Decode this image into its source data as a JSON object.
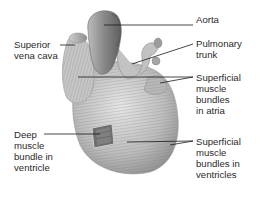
{
  "diagram": {
    "labels": [
      {
        "id": "aorta",
        "text": "Aorta",
        "x": 196,
        "y": 14
      },
      {
        "id": "pulmonary-trunk",
        "text": "Pulmonary\ntrunk",
        "x": 196,
        "y": 39
      },
      {
        "id": "superficial-atria",
        "text": "Superficial\nmuscle\nbundles\nin atria",
        "x": 196,
        "y": 73
      },
      {
        "id": "superior-vena-cava",
        "text": "Superior\nvena cava",
        "x": 14,
        "y": 40
      },
      {
        "id": "deep-ventricle",
        "text": "Deep\nmuscle\nbundle in\nventricle",
        "x": 14,
        "y": 130
      },
      {
        "id": "superficial-ventricles",
        "text": "Superficial\nmuscle\nbundles in\nventricles",
        "x": 196,
        "y": 137
      }
    ],
    "colors": {
      "text": "#2a2a2a",
      "leader_line": "#1a1a1a",
      "heart_light": "#d9d9d9",
      "heart_mid": "#a8a8a8",
      "heart_dark": "#6e6e6e"
    }
  }
}
